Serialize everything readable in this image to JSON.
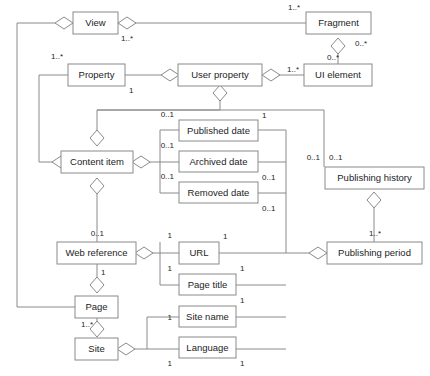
{
  "diagram": {
    "type": "uml-class-diagram",
    "title": "",
    "width": 430,
    "height": 376,
    "stroke_color": "#8a8a8a",
    "text_color": "#1d1d1d",
    "background_color": "#ffffff",
    "classes": [
      {
        "id": "view",
        "label": "View",
        "x": 73,
        "y": 12,
        "w": 45,
        "h": 22
      },
      {
        "id": "fragment",
        "label": "Fragment",
        "x": 306,
        "y": 12,
        "w": 65,
        "h": 22
      },
      {
        "id": "property",
        "label": "Property",
        "x": 68,
        "y": 64,
        "w": 57,
        "h": 22
      },
      {
        "id": "user-property",
        "label": "User property",
        "x": 178,
        "y": 64,
        "w": 84,
        "h": 22
      },
      {
        "id": "ui-element",
        "label": "UI element",
        "x": 304,
        "y": 64,
        "w": 68,
        "h": 22
      },
      {
        "id": "published-date",
        "label": "Published date",
        "x": 179,
        "y": 120,
        "w": 79,
        "h": 21
      },
      {
        "id": "content-item",
        "label": "Content item",
        "x": 61,
        "y": 151,
        "w": 72,
        "h": 22
      },
      {
        "id": "archived-date",
        "label": "Archived date",
        "x": 179,
        "y": 151,
        "w": 79,
        "h": 21
      },
      {
        "id": "publishing-history",
        "label": "Publishing history",
        "x": 325,
        "y": 167,
        "w": 99,
        "h": 22
      },
      {
        "id": "removed-date",
        "label": "Removed date",
        "x": 179,
        "y": 182,
        "w": 79,
        "h": 21
      },
      {
        "id": "web-reference",
        "label": "Web reference",
        "x": 57,
        "y": 242,
        "w": 79,
        "h": 22
      },
      {
        "id": "url",
        "label": "URL",
        "x": 179,
        "y": 242,
        "w": 40,
        "h": 22
      },
      {
        "id": "publishing-period",
        "label": "Publishing period",
        "x": 327,
        "y": 242,
        "w": 95,
        "h": 22
      },
      {
        "id": "page-title",
        "label": "Page title",
        "x": 179,
        "y": 274,
        "w": 57,
        "h": 21
      },
      {
        "id": "page",
        "label": "Page",
        "x": 75,
        "y": 296,
        "w": 43,
        "h": 22
      },
      {
        "id": "site-name",
        "label": "Site name",
        "x": 179,
        "y": 306,
        "w": 57,
        "h": 21
      },
      {
        "id": "site",
        "label": "Site",
        "x": 75,
        "y": 338,
        "w": 43,
        "h": 22
      },
      {
        "id": "language",
        "label": "Language",
        "x": 179,
        "y": 337,
        "w": 57,
        "h": 21
      }
    ],
    "multiplicities": [
      {
        "id": "m-fragment-view",
        "text": "1..*",
        "x": 300,
        "y": 8,
        "anchor": "end"
      },
      {
        "id": "m-view-fragment",
        "text": "1..*",
        "x": 121,
        "y": 39,
        "anchor": "start"
      },
      {
        "id": "m-fragment-ui",
        "text": "0..*",
        "x": 355,
        "y": 44,
        "anchor": "start"
      },
      {
        "id": "m-ui-fragment",
        "text": "0..*",
        "x": 339,
        "y": 58,
        "anchor": "end"
      },
      {
        "id": "m-property-view",
        "text": "1..*",
        "x": 63,
        "y": 57,
        "anchor": "end"
      },
      {
        "id": "m-property-user",
        "text": "1",
        "x": 129,
        "y": 91,
        "anchor": "start"
      },
      {
        "id": "m-ui-user",
        "text": "1..*",
        "x": 299,
        "y": 70,
        "anchor": "end"
      },
      {
        "id": "m-published-content",
        "text": "0..1",
        "x": 174,
        "y": 115,
        "anchor": "end"
      },
      {
        "id": "m-published-right",
        "text": "1",
        "x": 262,
        "y": 116,
        "anchor": "start"
      },
      {
        "id": "m-archived-content",
        "text": "0..1",
        "x": 174,
        "y": 146,
        "anchor": "end"
      },
      {
        "id": "m-archived-right",
        "text": "0..1",
        "x": 262,
        "y": 178,
        "anchor": "start"
      },
      {
        "id": "m-removed-content",
        "text": "0..1",
        "x": 174,
        "y": 177,
        "anchor": "end"
      },
      {
        "id": "m-removed-right",
        "text": "0..1",
        "x": 262,
        "y": 209,
        "anchor": "start"
      },
      {
        "id": "m-history-left",
        "text": "0..1",
        "x": 320,
        "y": 158,
        "anchor": "end"
      },
      {
        "id": "m-history-right",
        "text": "0..1",
        "x": 329,
        "y": 158,
        "anchor": "start"
      },
      {
        "id": "m-webref-content",
        "text": "0..1",
        "x": 104,
        "y": 234,
        "anchor": "end"
      },
      {
        "id": "m-url-left",
        "text": "1",
        "x": 172,
        "y": 236,
        "anchor": "end"
      },
      {
        "id": "m-url-right",
        "text": "1",
        "x": 223,
        "y": 237,
        "anchor": "start"
      },
      {
        "id": "m-period-history",
        "text": "1..*",
        "x": 369,
        "y": 234,
        "anchor": "start"
      },
      {
        "id": "m-pagetitle-left",
        "text": "1",
        "x": 172,
        "y": 269,
        "anchor": "end"
      },
      {
        "id": "m-pagetitle-right",
        "text": "1",
        "x": 240,
        "y": 269,
        "anchor": "start"
      },
      {
        "id": "m-page-webref",
        "text": "1",
        "x": 101,
        "y": 273,
        "anchor": "start"
      },
      {
        "id": "m-sitename-right",
        "text": "1",
        "x": 240,
        "y": 301,
        "anchor": "start"
      },
      {
        "id": "m-sitename-left",
        "text": "1",
        "x": 172,
        "y": 318,
        "anchor": "end"
      },
      {
        "id": "m-site-page",
        "text": "1..*",
        "x": 93,
        "y": 325,
        "anchor": "end"
      },
      {
        "id": "m-language-left",
        "text": "1",
        "x": 172,
        "y": 364,
        "anchor": "end"
      },
      {
        "id": "m-language-right",
        "text": "1",
        "x": 240,
        "y": 364,
        "anchor": "start"
      }
    ],
    "connectors": [
      {
        "id": "c-view-to-left-rail",
        "points": "73,23 63,23"
      },
      {
        "id": "c-left-rail-page",
        "points": "55,23 17,23 17,307 75,307"
      },
      {
        "id": "c-view-fragment",
        "points": "118,23 306,23"
      },
      {
        "id": "c-fragment-ui",
        "points": "338,41 338,64"
      },
      {
        "id": "c-property-user",
        "points": "125,75 170,75"
      },
      {
        "id": "c-user-ui",
        "points": "270,75 304,75"
      },
      {
        "id": "c-property-left-rail",
        "points": "68,75 39,75 39,162 53,162"
      },
      {
        "id": "c-user-content-rail",
        "points": "220,99 220,110 97,110 97,144"
      },
      {
        "id": "c-content-published",
        "points": "141,162 160,162 160,130 179,130"
      },
      {
        "id": "c-content-archived",
        "points": "160,162 179,162"
      },
      {
        "id": "c-content-removed",
        "points": "160,162 160,193 179,193"
      },
      {
        "id": "c-published-right",
        "points": "258,130 286,130 286,253"
      },
      {
        "id": "c-archived-right",
        "points": "258,162 286,162"
      },
      {
        "id": "c-removed-right",
        "points": "258,193 286,193"
      },
      {
        "id": "c-rail-history",
        "points": "97,110 324,110 324,167"
      },
      {
        "id": "c-history-period",
        "points": "374,196 374,242"
      },
      {
        "id": "c-content-webref",
        "points": "97,180 97,242"
      },
      {
        "id": "c-webref-url",
        "points": "144,253 160,253 160,242"
      },
      {
        "id": "c-webref-fan",
        "points": "160,253 179,253"
      },
      {
        "id": "c-webref-pagetitle",
        "points": "160,253 160,285 179,285"
      },
      {
        "id": "c-url-period",
        "points": "219,253 310,253"
      },
      {
        "id": "c-pagetitle-right",
        "points": "236,285 286,285"
      },
      {
        "id": "c-webref-page",
        "points": "97,264 97,289"
      },
      {
        "id": "c-page-site",
        "points": "97,318 97,331"
      },
      {
        "id": "c-site-fan",
        "points": "126,349 147,349 147,317 179,317"
      },
      {
        "id": "c-site-language",
        "points": "147,349 179,349"
      },
      {
        "id": "c-sitename-right",
        "points": "236,317 286,317"
      },
      {
        "id": "c-language-right",
        "points": "236,349 286,349"
      }
    ],
    "diamonds": [
      {
        "id": "d-view-left",
        "cx": 64,
        "cy": 23,
        "rx": 9,
        "ry": 6
      },
      {
        "id": "d-view-right",
        "cx": 127,
        "cy": 23,
        "rx": 9,
        "ry": 6
      },
      {
        "id": "d-fragment-bottom",
        "cx": 338,
        "cy": 46,
        "rx": 7,
        "ry": 8
      },
      {
        "id": "d-property-left",
        "cx": 61,
        "cy": 162,
        "rx": 9,
        "ry": 6
      },
      {
        "id": "d-user-left",
        "cx": 170,
        "cy": 75,
        "rx": 9,
        "ry": 6
      },
      {
        "id": "d-user-right",
        "cx": 271,
        "cy": 75,
        "rx": 9,
        "ry": 6
      },
      {
        "id": "d-user-bottom",
        "cx": 220,
        "cy": 93,
        "rx": 7,
        "ry": 8
      },
      {
        "id": "d-content-top",
        "cx": 97,
        "cy": 138,
        "rx": 7,
        "ry": 8
      },
      {
        "id": "d-content-right",
        "cx": 141,
        "cy": 162,
        "rx": 9,
        "ry": 6
      },
      {
        "id": "d-content-bottom",
        "cx": 97,
        "cy": 186,
        "rx": 7,
        "ry": 8
      },
      {
        "id": "d-history-bottom",
        "cx": 374,
        "cy": 200,
        "rx": 7,
        "ry": 8
      },
      {
        "id": "d-webref-right",
        "cx": 144,
        "cy": 253,
        "rx": 9,
        "ry": 6
      },
      {
        "id": "d-period-left",
        "cx": 318,
        "cy": 253,
        "rx": 9,
        "ry": 6
      },
      {
        "id": "d-page-top",
        "cx": 97,
        "cy": 285,
        "rx": 7,
        "ry": 8
      },
      {
        "id": "d-site-top",
        "cx": 97,
        "cy": 329,
        "rx": 7,
        "ry": 8
      },
      {
        "id": "d-site-right",
        "cx": 126,
        "cy": 349,
        "rx": 9,
        "ry": 6
      }
    ]
  }
}
